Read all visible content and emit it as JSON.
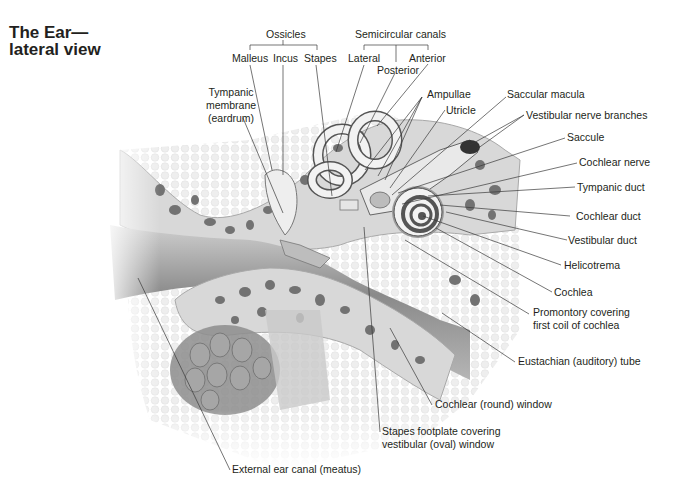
{
  "title": {
    "line1": "The Ear—",
    "line2": "lateral view"
  },
  "groups": {
    "ossicles": {
      "label": "Ossicles",
      "members": [
        "Malleus",
        "Incus",
        "Stapes"
      ]
    },
    "semicircular_canals": {
      "label": "Semicircular canals",
      "members": [
        "Lateral",
        "Posterior",
        "Anterior"
      ]
    }
  },
  "labels": {
    "malleus": "Malleus",
    "incus": "Incus",
    "stapes": "Stapes",
    "lateral": "Lateral",
    "posterior": "Posterior",
    "anterior": "Anterior",
    "tympanic_membrane": [
      "Tympanic",
      "membrane",
      "(eardrum)"
    ],
    "ampullae": "Ampullae",
    "utricle": "Utricle",
    "saccular_macula": "Saccular macula",
    "vestibular_nerve_branches": "Vestibular nerve branches",
    "saccule": "Saccule",
    "cochlear_nerve": "Cochlear nerve",
    "tympanic_duct": "Tympanic duct",
    "cochlear_duct": "Cochlear duct",
    "vestibular_duct": "Vestibular duct",
    "helicotrema": "Helicotrema",
    "cochlea": "Cochlea",
    "promontory": [
      "Promontory covering",
      "first coil of cochlea"
    ],
    "eustachian_tube": "Eustachian (auditory) tube",
    "round_window": "Cochlear (round) window",
    "stapes_footplate": [
      "Stapes footplate covering",
      "vestibular (oval) window"
    ],
    "external_ear_canal": "External ear canal (meatus)"
  },
  "colors": {
    "text": "#231f20",
    "leader": "#3a3a3a",
    "bone_light": "#d9d9d9",
    "bone_pore": "#6e6e6e",
    "canal_dark": "#7a7a7a",
    "soft_tissue": "#eeeeee",
    "cochlea": "#f2f2f2"
  }
}
